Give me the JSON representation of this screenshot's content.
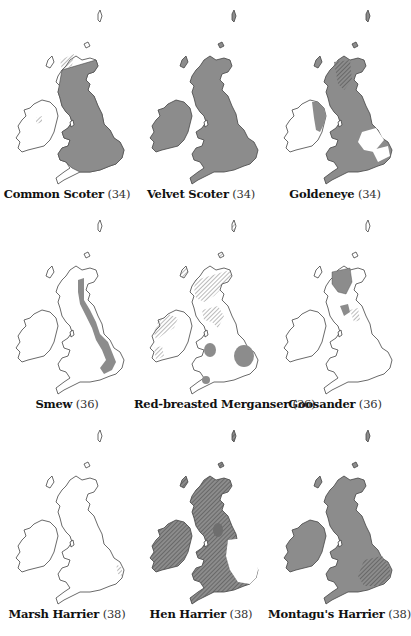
{
  "figure": {
    "colors": {
      "fill": "#8c8c8c",
      "fill_dark": "#6e6e6e",
      "outline": "#444444",
      "hatch": "#777777",
      "background": "#ffffff"
    },
    "maps": [
      {
        "name": "Common Scoter",
        "page": "(34)"
      },
      {
        "name": "Velvet Scoter",
        "page": "(34)"
      },
      {
        "name": "Goldeneye",
        "page": "(34)"
      },
      {
        "name": "Smew",
        "page": "(36)"
      },
      {
        "name": "Red-breasted Merganser",
        "page": "(36)"
      },
      {
        "name": "Goosander",
        "page": "(36)"
      },
      {
        "name": "Marsh Harrier",
        "page": "(38)"
      },
      {
        "name": "Hen Harrier",
        "page": "(38)"
      },
      {
        "name": "Montagu's Harrier",
        "page": "(38)"
      }
    ]
  }
}
